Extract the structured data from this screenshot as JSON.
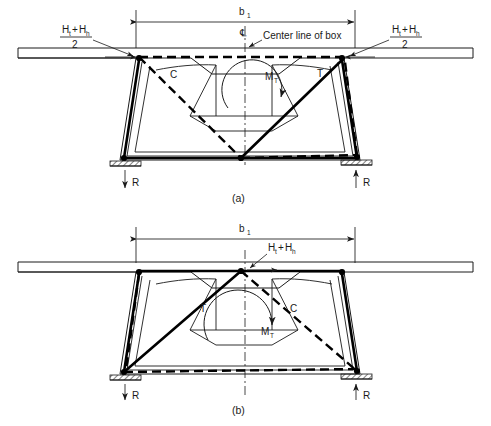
{
  "figure": {
    "title_caption_a": "(a)",
    "title_caption_b": "(b)",
    "centerline_note": "Center line of box",
    "centerline_symbol": "℄"
  },
  "labels": {
    "b_main": "b",
    "b_sub": "1",
    "H_numer_1": "H",
    "H_sub_1": "t",
    "H_plus": "+",
    "H_numer_2": "H",
    "H_sub_2": "h",
    "H_denom": "2",
    "force_C": "C",
    "force_T": "T",
    "moment_main": "M",
    "moment_sub": "T",
    "reaction": "R"
  },
  "panel_a": {
    "caption": "(a)",
    "dim_label": "b₁",
    "left_force_label": "H₁+H₍h₎ / 2",
    "right_force_label": "H₁+H₍h₎ / 2",
    "diagonal_left": "C",
    "diagonal_right": "T",
    "torsion": "M_T",
    "reaction_left": "R",
    "reaction_right": "R",
    "reaction_left_dir": "down",
    "reaction_right_dir": "up",
    "centerline_note": "Center line of box"
  },
  "panel_b": {
    "caption": "(b)",
    "dim_label": "b₁",
    "apex_force_label": "H₁+H₍h₎",
    "diagonal_left": "T",
    "diagonal_right": "C",
    "torsion": "M_T",
    "reaction_left": "R",
    "reaction_right": "R",
    "reaction_left_dir": "down",
    "reaction_right_dir": "up"
  },
  "colors": {
    "ink": "#1a1a1a",
    "bold_member": "#000000",
    "background": "#ffffff"
  }
}
